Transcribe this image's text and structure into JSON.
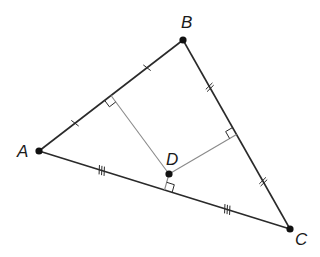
{
  "diagram": {
    "type": "triangle-circumcenter",
    "points": {
      "A": {
        "label": "A",
        "x": 39,
        "y": 151,
        "label_x": 17,
        "label_y": 157
      },
      "B": {
        "label": "B",
        "x": 183,
        "y": 40,
        "label_x": 181,
        "label_y": 28
      },
      "C": {
        "label": "C",
        "x": 290,
        "y": 229,
        "label_x": 295,
        "label_y": 245
      },
      "D": {
        "label": "D",
        "x": 169,
        "y": 174,
        "label_x": 166,
        "label_y": 165
      }
    },
    "sides": [
      {
        "from": "A",
        "to": "B",
        "tick_count": 1
      },
      {
        "from": "B",
        "to": "C",
        "tick_count": 2
      },
      {
        "from": "A",
        "to": "C",
        "tick_count": 3
      }
    ],
    "perpendicular_bisectors": [
      {
        "side": "AB",
        "foot_x": 111,
        "foot_y": 95.5
      },
      {
        "side": "BC",
        "foot_x": 236.5,
        "foot_y": 134.5
      },
      {
        "side": "AC",
        "foot_x": 164.5,
        "foot_y": 190
      }
    ],
    "colors": {
      "side": "#2a2a2a",
      "bisector": "#8a8a8a",
      "point": "#111111"
    }
  }
}
